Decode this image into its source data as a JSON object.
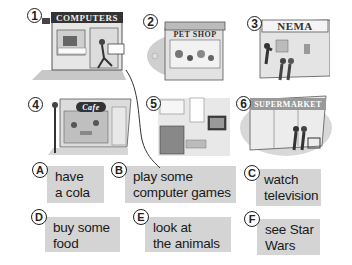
{
  "pictures": [
    {
      "number": "1",
      "label": "computers-shop",
      "sign": "COMPUTERS"
    },
    {
      "number": "2",
      "label": "pet-shop",
      "sign": "PET SHOP"
    },
    {
      "number": "3",
      "label": "cinema",
      "sign": "NEMA"
    },
    {
      "number": "4",
      "label": "cafe",
      "sign": "Cafe"
    },
    {
      "number": "5",
      "label": "living-room",
      "sign": ""
    },
    {
      "number": "6",
      "label": "supermarket",
      "sign": "SUPERMARKET"
    }
  ],
  "activities": [
    {
      "letter": "A",
      "line1": "have",
      "line2": "a cola"
    },
    {
      "letter": "B",
      "line1": "play some",
      "line2": "computer games"
    },
    {
      "letter": "C",
      "line1": "watch",
      "line2": "television"
    },
    {
      "letter": "D",
      "line1": "buy some",
      "line2": "food"
    },
    {
      "letter": "E",
      "line1": "look at",
      "line2": "the animals"
    },
    {
      "letter": "F",
      "line1": "see Star",
      "line2": "Wars"
    }
  ],
  "colors": {
    "box_bg": "#d4d4d4",
    "outline": "#222222"
  }
}
